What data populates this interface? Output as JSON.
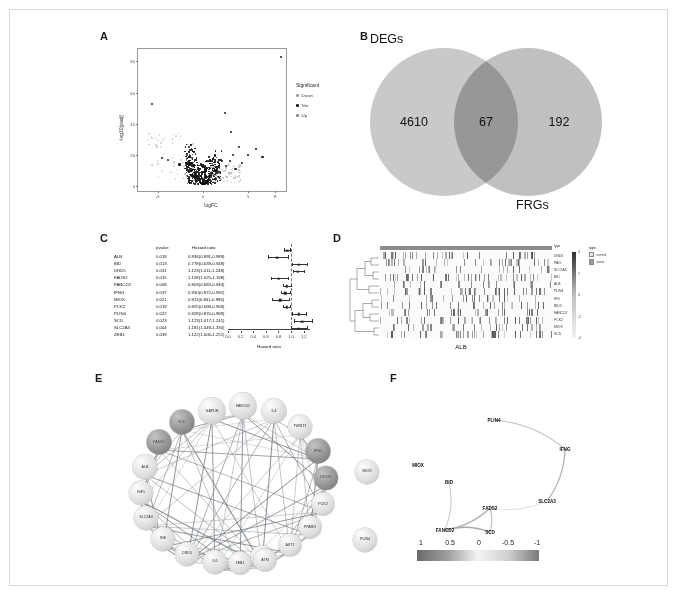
{
  "figure": {
    "panels": [
      "A",
      "B",
      "C",
      "D",
      "E",
      "F"
    ]
  },
  "panelA": {
    "label": "A",
    "xlabel": "logFC",
    "ylabel": "-log10(padj)",
    "xticks": [
      "-5",
      "0",
      "5",
      "8"
    ],
    "yticks": [
      "0",
      "20",
      "40",
      "60",
      "80"
    ],
    "legend": {
      "title": "Significant",
      "items": [
        {
          "name": "Down",
          "color": "#9e9e9e"
        },
        {
          "name": "Not",
          "color": "#1a1a1a"
        },
        {
          "name": "Up",
          "color": "#8a8a8a"
        }
      ]
    }
  },
  "panelB": {
    "label": "B",
    "left_set": "DEGs",
    "right_set": "FRGs",
    "left_only": "4610",
    "intersection": "67",
    "right_only": "192",
    "left_color": "#c9c9c9",
    "right_color": "#c0c0c0",
    "overlap_color": "#8f8f8f"
  },
  "panelC": {
    "label": "C",
    "headers": {
      "gene": "",
      "pvalue": "pvalue",
      "hr": "Hazard ratio"
    },
    "xlabel": "Hazard ratio",
    "xticks": [
      "0.0",
      "0.2",
      "0.4",
      "0.6",
      "0.8",
      "1.0",
      "1.2"
    ],
    "rows": [
      {
        "gene": "ALB",
        "pvalue": "0.018",
        "hr_text": "0.936(0.891-0.989)",
        "hr": 0.936,
        "lo": 0.891,
        "hi": 0.989
      },
      {
        "gene": "BID",
        "pvalue": "0.013",
        "hr_text": "0.778(0.639-0.948)",
        "hr": 0.778,
        "lo": 0.639,
        "hi": 0.948
      },
      {
        "gene": "DRD5",
        "pvalue": "0.031",
        "hr_text": "1.123(1.011-1.248)",
        "hr": 1.123,
        "lo": 1.011,
        "hi": 1.248
      },
      {
        "gene": "FADS2",
        "pvalue": "0.015",
        "hr_text": "1.108(1.025-1.198)",
        "hr": 1.108,
        "lo": 1.025,
        "hi": 1.198
      },
      {
        "gene": "FANCD2",
        "pvalue": "0.008",
        "hr_text": "0.803(0.683-0.944)",
        "hr": 0.803,
        "lo": 0.683,
        "hi": 0.944
      },
      {
        "gene": "IFNG",
        "pvalue": "0.037",
        "hr_text": "0.930(0.872-0.992)",
        "hr": 0.93,
        "lo": 0.872,
        "hi": 0.992
      },
      {
        "gene": "MIOX",
        "pvalue": "0.021",
        "hr_text": "0.911(0.841-0.986)",
        "hr": 0.911,
        "lo": 0.841,
        "hi": 0.986
      },
      {
        "gene": "PCK2",
        "pvalue": "0.019",
        "hr_text": "0.825(0.698-0.968)",
        "hr": 0.825,
        "lo": 0.698,
        "hi": 0.968
      },
      {
        "gene": "PLIN4",
        "pvalue": "0.022",
        "hr_text": "0.928(0.870-0.989)",
        "hr": 0.928,
        "lo": 0.87,
        "hi": 0.989
      },
      {
        "gene": "SCD",
        "pvalue": "0.023",
        "hr_text": "1.123(1.017-1.241)",
        "hr": 1.123,
        "lo": 1.017,
        "hi": 1.241
      },
      {
        "gene": "SLC2A3",
        "pvalue": "0.004",
        "hr_text": "1.181(1.049-1.330)",
        "hr": 1.181,
        "lo": 1.049,
        "hi": 1.33
      },
      {
        "gene": "ZEB1",
        "pvalue": "0.039",
        "hr_text": "1.122(1.006-1.251)",
        "hr": 1.122,
        "lo": 1.006,
        "hi": 1.251
      }
    ]
  },
  "panelD": {
    "label": "D",
    "title": "ALB",
    "annotation_label": "type",
    "row_labels": [
      "DRD5",
      "PAG",
      "SLC2A3",
      "BID",
      "ALB",
      "PLIN4",
      "IFG",
      "BID2",
      "FANCD2",
      "PCK2",
      "MIOX",
      "SCD"
    ],
    "legend": {
      "title": "type",
      "items": [
        {
          "name": "normal",
          "color": "#e8e8e8"
        },
        {
          "name": "tumor",
          "color": "#9a9a9a"
        }
      ]
    },
    "colorbar_ticks": [
      "4",
      "2",
      "0",
      "-2",
      "-4"
    ]
  },
  "panelE": {
    "label": "E",
    "nodes": [
      {
        "name": "GAPDH",
        "x": 117,
        "y": 31,
        "r": 13.5,
        "shade": "light"
      },
      {
        "name": "FANCD2",
        "x": 148,
        "y": 26,
        "r": 13.5,
        "shade": "light"
      },
      {
        "name": "IL4",
        "x": 179,
        "y": 31,
        "r": 12.5,
        "shade": "light"
      },
      {
        "name": "SCD",
        "x": 87,
        "y": 42,
        "r": 12.5,
        "shade": "dark"
      },
      {
        "name": "TWIST1",
        "x": 205,
        "y": 47,
        "r": 12.0,
        "shade": "light"
      },
      {
        "name": "FADS2",
        "x": 64,
        "y": 62,
        "r": 12.5,
        "shade": "dark"
      },
      {
        "name": "IFNG",
        "x": 223,
        "y": 71,
        "r": 12.5,
        "shade": "dark"
      },
      {
        "name": "ALB",
        "x": 50,
        "y": 87,
        "r": 12.5,
        "shade": "light"
      },
      {
        "name": "DECR1",
        "x": 231,
        "y": 98,
        "r": 12.0,
        "shade": "dark"
      },
      {
        "name": "IGF1",
        "x": 46,
        "y": 113,
        "r": 12.0,
        "shade": "light"
      },
      {
        "name": "PCK2",
        "x": 228,
        "y": 124,
        "r": 11.5,
        "shade": "light"
      },
      {
        "name": "SLC2A3",
        "x": 51,
        "y": 138,
        "r": 12.0,
        "shade": "light"
      },
      {
        "name": "PPARG",
        "x": 215,
        "y": 147,
        "r": 11.5,
        "shade": "light"
      },
      {
        "name": "INS",
        "x": 68,
        "y": 159,
        "r": 12.0,
        "shade": "light"
      },
      {
        "name": "AKT1",
        "x": 195,
        "y": 165,
        "r": 11.5,
        "shade": "light"
      },
      {
        "name": "DRD5",
        "x": 92,
        "y": 174,
        "r": 12.0,
        "shade": "light"
      },
      {
        "name": "TNF",
        "x": 167,
        "y": 177,
        "r": 11.5,
        "shade": "light"
      },
      {
        "name": "IL6",
        "x": 120,
        "y": 182,
        "r": 12.0,
        "shade": "light"
      },
      {
        "name": "ZEB1",
        "x": 145,
        "y": 183,
        "r": 11.5,
        "shade": "light"
      },
      {
        "name": "ATM",
        "x": 170,
        "y": 180,
        "r": 11.5,
        "shade": "light"
      },
      {
        "name": "MIOX",
        "x": 272,
        "y": 92,
        "r": 12.0,
        "shade": "light"
      },
      {
        "name": "PLIN4",
        "x": 270,
        "y": 160,
        "r": 12.0,
        "shade": "light"
      }
    ]
  },
  "panelF": {
    "label": "F",
    "nodes": [
      {
        "name": "MIOX",
        "x": 28,
        "y": 93
      },
      {
        "name": "PLIN4",
        "x": 104,
        "y": 48
      },
      {
        "name": "IFNG",
        "x": 175,
        "y": 77
      },
      {
        "name": "BID",
        "x": 59,
        "y": 110
      },
      {
        "name": "FADS2",
        "x": 100,
        "y": 136
      },
      {
        "name": "SLC2A3",
        "x": 157,
        "y": 129
      },
      {
        "name": "FANCD2",
        "x": 55,
        "y": 158
      },
      {
        "name": "SCD",
        "x": 100,
        "y": 160
      }
    ],
    "scale_ticks": [
      "1",
      "0.5",
      "0",
      "-0.5",
      "-1"
    ]
  }
}
